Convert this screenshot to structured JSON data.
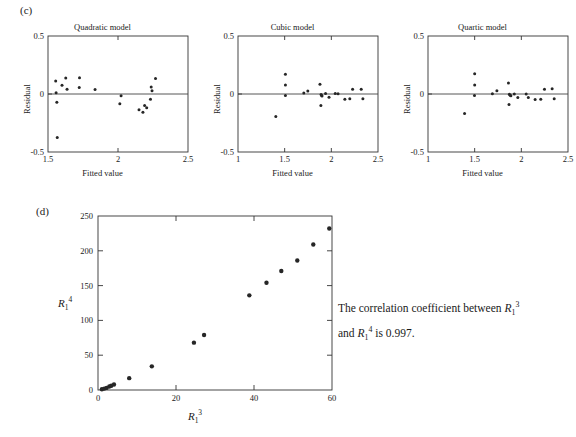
{
  "figure": {
    "panel_c_label": "(c)",
    "panel_d_label": "(d)"
  },
  "note": {
    "line1_a": "The correlation coefficient between ",
    "line1_b": " and ",
    "line1_c": " is",
    "line2": "0.997.",
    "symbol_r3_base": "R",
    "symbol_r3_sub": "1",
    "symbol_r3_sup": "3",
    "symbol_r4_base": "R",
    "symbol_r4_sub": "1",
    "symbol_r4_sup": "4",
    "full_text": "The correlation coefficient between R_1^3 and R_1^4 is 0.997."
  },
  "chart_data": [
    {
      "id": "quadratic",
      "type": "scatter",
      "title": "Quadratic model",
      "xlabel": "Fitted value",
      "ylabel": "Residual",
      "xlim": [
        1.5,
        2.5
      ],
      "ylim": [
        -0.5,
        0.5
      ],
      "xticks": [
        1.5,
        2.0,
        2.5
      ],
      "xticklabels": [
        "1.5",
        "2",
        "2.5"
      ],
      "yticks": [
        -0.5,
        0.0,
        0.5
      ],
      "yticklabels": [
        "-0.5",
        "0",
        "0.5"
      ],
      "grid": false,
      "zero_line": true,
      "points": [
        {
          "x": 1.555,
          "y": 0.113
        },
        {
          "x": 1.558,
          "y": 0.01
        },
        {
          "x": 1.563,
          "y": -0.072
        },
        {
          "x": 1.566,
          "y": -0.375
        },
        {
          "x": 1.6,
          "y": 0.075
        },
        {
          "x": 1.627,
          "y": 0.138
        },
        {
          "x": 1.636,
          "y": 0.04
        },
        {
          "x": 1.725,
          "y": 0.14
        },
        {
          "x": 1.723,
          "y": 0.055
        },
        {
          "x": 1.836,
          "y": 0.038
        },
        {
          "x": 2.022,
          "y": -0.016
        },
        {
          "x": 2.013,
          "y": -0.085
        },
        {
          "x": 2.15,
          "y": -0.135
        },
        {
          "x": 2.178,
          "y": -0.158
        },
        {
          "x": 2.19,
          "y": -0.1
        },
        {
          "x": 2.205,
          "y": -0.118
        },
        {
          "x": 2.232,
          "y": -0.045
        },
        {
          "x": 2.237,
          "y": 0.06
        },
        {
          "x": 2.243,
          "y": 0.028
        },
        {
          "x": 2.268,
          "y": 0.133
        }
      ]
    },
    {
      "id": "cubic",
      "type": "scatter",
      "title": "Cubic model",
      "xlabel": "Fitted value",
      "ylabel": "Residual",
      "xlim": [
        1.0,
        2.5
      ],
      "ylim": [
        -0.5,
        0.5
      ],
      "xticks": [
        1.0,
        1.5,
        2.0,
        2.5
      ],
      "xticklabels": [
        "1",
        "1.5",
        "2",
        "2.5"
      ],
      "yticks": [
        -0.5,
        0.0,
        0.5
      ],
      "yticklabels": [
        "-0.5",
        "0",
        "0.5"
      ],
      "grid": false,
      "zero_line": true,
      "points": [
        {
          "x": 1.405,
          "y": -0.195
        },
        {
          "x": 1.508,
          "y": 0.17
        },
        {
          "x": 1.508,
          "y": 0.078
        },
        {
          "x": 1.508,
          "y": -0.012
        },
        {
          "x": 1.705,
          "y": 0.008
        },
        {
          "x": 1.748,
          "y": 0.025
        },
        {
          "x": 1.878,
          "y": 0.083
        },
        {
          "x": 1.89,
          "y": -0.005
        },
        {
          "x": 1.896,
          "y": -0.012
        },
        {
          "x": 1.9,
          "y": -0.018
        },
        {
          "x": 1.888,
          "y": -0.1
        },
        {
          "x": 1.938,
          "y": 0.005
        },
        {
          "x": 1.975,
          "y": -0.028
        },
        {
          "x": 2.042,
          "y": 0.005
        },
        {
          "x": 2.072,
          "y": 0.002
        },
        {
          "x": 2.145,
          "y": -0.045
        },
        {
          "x": 2.198,
          "y": -0.042
        },
        {
          "x": 2.228,
          "y": 0.042
        },
        {
          "x": 2.32,
          "y": 0.042
        },
        {
          "x": 2.338,
          "y": -0.042
        }
      ]
    },
    {
      "id": "quartic",
      "type": "scatter",
      "title": "Quartic model",
      "xlabel": "Fitted value",
      "ylabel": "Residual",
      "xlim": [
        1.0,
        2.5
      ],
      "ylim": [
        -0.5,
        0.5
      ],
      "xticks": [
        1.0,
        1.5,
        2.0,
        2.5
      ],
      "xticklabels": [
        "1",
        "1.5",
        "2",
        "2.5"
      ],
      "yticks": [
        -0.5,
        0.0,
        0.5
      ],
      "yticklabels": [
        "-0.5",
        "0",
        "0.5"
      ],
      "grid": false,
      "zero_line": true,
      "points": [
        {
          "x": 1.392,
          "y": -0.168
        },
        {
          "x": 1.5,
          "y": 0.175
        },
        {
          "x": 1.5,
          "y": 0.078
        },
        {
          "x": 1.498,
          "y": -0.012
        },
        {
          "x": 1.69,
          "y": 0.002
        },
        {
          "x": 1.738,
          "y": 0.028
        },
        {
          "x": 1.862,
          "y": 0.095
        },
        {
          "x": 1.872,
          "y": -0.002
        },
        {
          "x": 1.88,
          "y": -0.01
        },
        {
          "x": 1.888,
          "y": -0.015
        },
        {
          "x": 1.868,
          "y": -0.09
        },
        {
          "x": 1.925,
          "y": 0.0
        },
        {
          "x": 1.962,
          "y": -0.03
        },
        {
          "x": 2.052,
          "y": 0.0
        },
        {
          "x": 2.075,
          "y": -0.03
        },
        {
          "x": 2.148,
          "y": -0.048
        },
        {
          "x": 2.208,
          "y": -0.045
        },
        {
          "x": 2.248,
          "y": 0.04
        },
        {
          "x": 2.33,
          "y": 0.045
        },
        {
          "x": 2.352,
          "y": -0.042
        }
      ]
    },
    {
      "id": "r1cubed-vs-r1fourth",
      "type": "scatter",
      "title": "",
      "xlabel": "R_1^3",
      "ylabel": "R_1^4",
      "xlim": [
        0,
        60
      ],
      "ylim": [
        0,
        250
      ],
      "xticks": [
        0,
        20,
        40,
        60
      ],
      "xticklabels": [
        "0",
        "20",
        "40",
        "60"
      ],
      "yticks": [
        0,
        50,
        100,
        150,
        200,
        250
      ],
      "yticklabels": [
        "0",
        "50",
        "100",
        "150",
        "200",
        "250"
      ],
      "grid": false,
      "zero_line": false,
      "points": [
        {
          "x": 1.0,
          "y": 1
        },
        {
          "x": 1.6,
          "y": 2
        },
        {
          "x": 2.2,
          "y": 3
        },
        {
          "x": 2.9,
          "y": 5
        },
        {
          "x": 3.4,
          "y": 6
        },
        {
          "x": 4.1,
          "y": 8
        },
        {
          "x": 8.0,
          "y": 17
        },
        {
          "x": 13.8,
          "y": 34
        },
        {
          "x": 24.6,
          "y": 68
        },
        {
          "x": 27.2,
          "y": 79
        },
        {
          "x": 38.8,
          "y": 136
        },
        {
          "x": 43.2,
          "y": 154
        },
        {
          "x": 47.0,
          "y": 171
        },
        {
          "x": 51.1,
          "y": 186
        },
        {
          "x": 55.2,
          "y": 209
        },
        {
          "x": 59.3,
          "y": 232
        }
      ]
    }
  ]
}
